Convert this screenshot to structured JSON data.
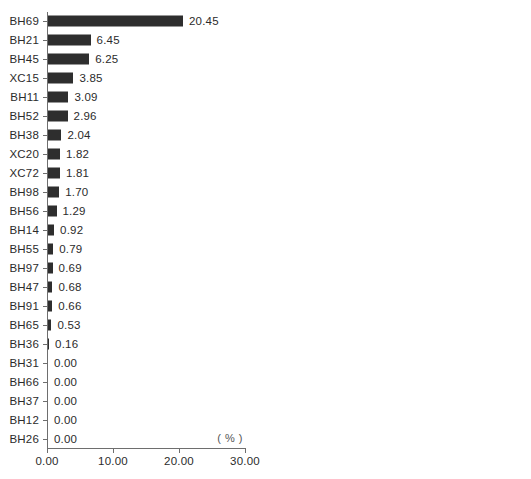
{
  "chart_data": [
    {
      "type": "bar",
      "orientation": "horizontal",
      "panel": "left",
      "title": "",
      "xlabel": "( % )",
      "ylabel": "",
      "unit": "( % )",
      "xlim": [
        0,
        30
      ],
      "xticks": [
        "0.00",
        "10.00",
        "20.00",
        "30.00"
      ],
      "xtick_values": [
        0,
        10,
        20,
        30
      ],
      "grid": false,
      "legend": "none",
      "bar_color": "#2e2e2e",
      "axis_color": "#6e6e6e",
      "categories": [
        "BH69",
        "BH21",
        "BH45",
        "XC15",
        "BH11",
        "BH52",
        "BH38",
        "XC20",
        "XC72",
        "BH98",
        "BH56",
        "BH14",
        "BH55",
        "BH97",
        "BH47",
        "BH91",
        "BH65",
        "BH36",
        "BH31",
        "BH66",
        "BH37",
        "BH12",
        "BH26"
      ],
      "values": [
        20.45,
        6.45,
        6.25,
        3.85,
        3.09,
        2.96,
        2.04,
        1.82,
        1.81,
        1.7,
        1.29,
        0.92,
        0.79,
        0.69,
        0.68,
        0.66,
        0.53,
        0.16,
        0.0,
        0.0,
        0.0,
        0.0,
        0.0
      ],
      "value_labels": [
        "20.45",
        "6.45",
        "6.25",
        "3.85",
        "3.09",
        "2.96",
        "2.04",
        "1.82",
        "1.81",
        "1.70",
        "1.29",
        "0.92",
        "0.79",
        "0.69",
        "0.68",
        "0.66",
        "0.53",
        "0.16",
        "0.00",
        "0.00",
        "0.00",
        "0.00",
        "0.00"
      ]
    },
    {
      "type": "bar",
      "orientation": "horizontal",
      "panel": "right",
      "title": "",
      "xlabel": "( % )",
      "ylabel": "",
      "unit": "( % )",
      "xlim": [
        0,
        30
      ],
      "xticks": [
        "0.00",
        "10.00",
        "20.00",
        "30.00"
      ],
      "xtick_values": [
        0,
        10,
        20,
        30
      ],
      "grid": false,
      "legend": "none",
      "bar_color": "#2e2e2e",
      "axis_color": "#6e6e6e",
      "categories": [
        "BH13",
        "BH48",
        "BH17",
        "BH76",
        "BH99",
        "BH15",
        "BH44",
        "BH64",
        "BH57",
        "BH25",
        "XC38",
        "BH50",
        "BH70",
        "BH20",
        "BH67",
        "BH79",
        "BH88",
        "XC42",
        "BH34",
        "BH23",
        "XC31",
        "BH74",
        "BH39",
        "XC64"
      ],
      "values": [
        0.0,
        0.0,
        0.0,
        0.0,
        0.0,
        0.0,
        0.0,
        0.0,
        0.0,
        0.0,
        0.0,
        0.0,
        0.0,
        0.0,
        0.0,
        0.0,
        0.0,
        0.0,
        0.0,
        0.0,
        0.0,
        0.0,
        0.0,
        0.0
      ],
      "value_labels": [
        "0.00",
        "0.00",
        "0.00",
        "0.00",
        "0.00",
        "0.00",
        "0.00",
        "0.00",
        "0.00",
        "0.00",
        "0.00",
        "0.00",
        "0.00",
        "0.00",
        "0.00",
        "0.00",
        "0.00",
        "0.00",
        "0.00",
        "0.00",
        "0.00",
        "0.00",
        "0.00",
        "0.00"
      ]
    }
  ]
}
